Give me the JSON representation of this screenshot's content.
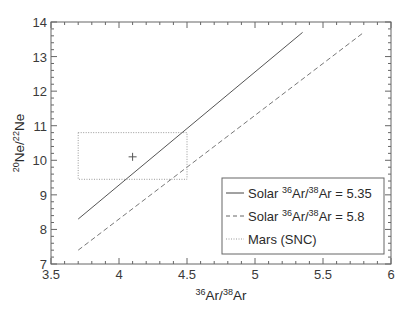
{
  "chart_data": {
    "type": "line",
    "title": "",
    "xlabel": {
      "pre_sup": "36",
      "base": "Ar/",
      "sup2": "38",
      "tail": "Ar"
    },
    "ylabel": {
      "pre_sup": "20",
      "base": "Ne/",
      "sup2": "22",
      "tail": "Ne"
    },
    "xlim": [
      3.5,
      6
    ],
    "ylim": [
      7,
      14
    ],
    "x_ticks": [
      "3.5",
      "4",
      "4.5",
      "5",
      "5.5",
      "6"
    ],
    "y_ticks": [
      "7",
      "8",
      "9",
      "10",
      "11",
      "12",
      "13",
      "14"
    ],
    "grid": false,
    "legend_position": "lower right",
    "series": [
      {
        "name": "Solar 36Ar/38Ar = 5.35",
        "style": "solid",
        "color": "#555555",
        "x": [
          3.7,
          5.35
        ],
        "y": [
          8.3,
          13.7
        ]
      },
      {
        "name": "Solar 36Ar/38Ar = 5.8",
        "style": "dashed",
        "color": "#777777",
        "x": [
          3.7,
          5.8
        ],
        "y": [
          7.4,
          13.7
        ]
      },
      {
        "name": "Mars (SNC)",
        "style": "dotted-box",
        "color": "#999999",
        "box": {
          "x": [
            3.7,
            4.5
          ],
          "y": [
            9.45,
            10.8
          ]
        },
        "marker": {
          "x": 4.1,
          "y": 10.1,
          "symbol": "+"
        }
      }
    ],
    "legend": [
      {
        "label_pre": "Solar ",
        "sup": "36",
        "mid": "Ar/",
        "sup2": "38",
        "tail": "Ar = 5.35"
      },
      {
        "label_pre": "Solar ",
        "sup": "36",
        "mid": "Ar/",
        "sup2": "38",
        "tail": "Ar = 5.8"
      },
      {
        "label_pre": "Mars (SNC)",
        "sup": "",
        "mid": "",
        "sup2": "",
        "tail": ""
      }
    ]
  }
}
